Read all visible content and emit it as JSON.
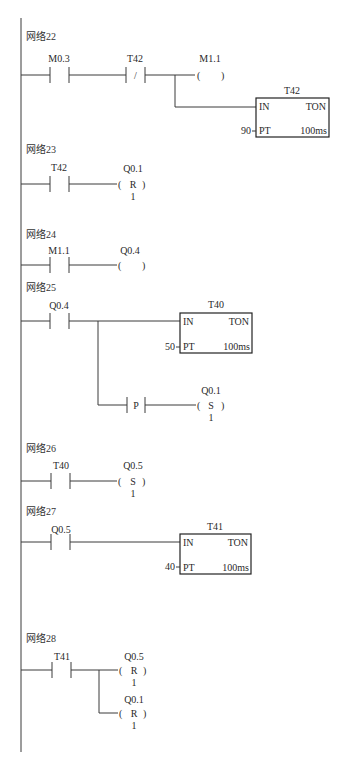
{
  "colors": {
    "line": "#3a3a3a",
    "text": "#2a2a2a",
    "background": "#ffffff"
  },
  "networks": [
    {
      "label": "网络22",
      "contacts": [
        {
          "type": "NO",
          "address": "M0.3"
        },
        {
          "type": "NC",
          "address": "T42",
          "symbol": "/"
        }
      ],
      "coil": {
        "address": "M1.1",
        "type": "output",
        "symbol": ""
      },
      "timer": {
        "name": "T42",
        "type": "TON",
        "in": "IN",
        "pt_label": "PT",
        "pt_value": "90",
        "base": "100ms"
      }
    },
    {
      "label": "网络23",
      "contacts": [
        {
          "type": "NO",
          "address": "T42"
        }
      ],
      "coil": {
        "address": "Q0.1",
        "type": "reset",
        "symbol": "R",
        "count": "1"
      }
    },
    {
      "label": "网络24",
      "contacts": [
        {
          "type": "NO",
          "address": "M1.1"
        }
      ],
      "coil": {
        "address": "Q0.4",
        "type": "output",
        "symbol": ""
      }
    },
    {
      "label": "网络25",
      "contacts": [
        {
          "type": "NO",
          "address": "Q0.4"
        }
      ],
      "timer": {
        "name": "T40",
        "type": "TON",
        "in": "IN",
        "pt_label": "PT",
        "pt_value": "50",
        "base": "100ms"
      },
      "edge": {
        "symbol": "P"
      },
      "coil": {
        "address": "Q0.1",
        "type": "set",
        "symbol": "S",
        "count": "1"
      }
    },
    {
      "label": "网络26",
      "contacts": [
        {
          "type": "NO",
          "address": "T40"
        }
      ],
      "coil": {
        "address": "Q0.5",
        "type": "set",
        "symbol": "S",
        "count": "1"
      }
    },
    {
      "label": "网络27",
      "contacts": [
        {
          "type": "NO",
          "address": "Q0.5"
        }
      ],
      "timer": {
        "name": "T41",
        "type": "TON",
        "in": "IN",
        "pt_label": "PT",
        "pt_value": "40",
        "base": "100ms"
      }
    },
    {
      "label": "网络28",
      "contacts": [
        {
          "type": "NO",
          "address": "T41"
        }
      ],
      "coils": [
        {
          "address": "Q0.5",
          "type": "reset",
          "symbol": "R",
          "count": "1"
        },
        {
          "address": "Q0.1",
          "type": "reset",
          "symbol": "R",
          "count": "1"
        }
      ]
    }
  ],
  "paren_open": "(",
  "paren_close": ")"
}
